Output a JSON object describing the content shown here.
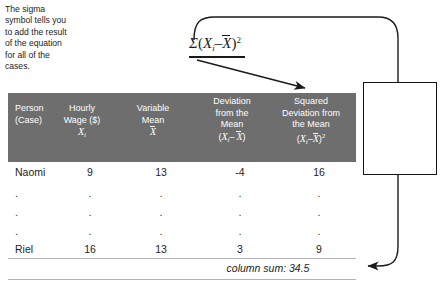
{
  "figure": {
    "formula": {
      "sigma": "Σ",
      "open": "(",
      "x_i": "X",
      "x_i_sub": "i",
      "minus": "–",
      "x_bar": "X",
      "close": ")",
      "exponent": "2",
      "plain_text": "Σ(Xi – X̄)²"
    },
    "table": {
      "headers": [
        {
          "line1": "Person",
          "line2": "(Case)",
          "line3": "",
          "symbol": ""
        },
        {
          "line1": "Hourly",
          "line2": "Wage ($)",
          "line3": "",
          "symbol": "X_i"
        },
        {
          "line1": "Variable",
          "line2": "Mean",
          "line3": "",
          "symbol": "X_bar"
        },
        {
          "line1": "Deviation",
          "line2": "from the",
          "line3": "Mean",
          "symbol": "(X_i - X_bar)"
        },
        {
          "line1": "Squared",
          "line2": "Deviation from",
          "line3": "the Mean",
          "symbol": "(X_i - X_bar)^2"
        }
      ],
      "rows": [
        {
          "person": "Naomi",
          "wage": "9",
          "mean": "13",
          "deviation": "-4",
          "squared": "16"
        },
        {
          "person": ".",
          "wage": ".",
          "mean": ".",
          "deviation": ".",
          "squared": "."
        },
        {
          "person": ".",
          "wage": ".",
          "mean": ".",
          "deviation": ".",
          "squared": "."
        },
        {
          "person": ".",
          "wage": ".",
          "mean": ".",
          "deviation": ".",
          "squared": "."
        },
        {
          "person": "Riel",
          "wage": "16",
          "mean": "13",
          "deviation": "3",
          "squared": "9"
        }
      ],
      "column_sum": "column sum: 34.5"
    },
    "callout": {
      "text": "The sigma symbol tells you to add the result of the equation for all of the cases."
    },
    "colors": {
      "header_background": "#6e6e6e",
      "header_text": "#ffffff",
      "body_text": "#1d1d1d",
      "rule": "#b3b3b3",
      "connector": "#1a1a1a",
      "callout_border": "#141414",
      "page_background": "#ffffff"
    }
  }
}
